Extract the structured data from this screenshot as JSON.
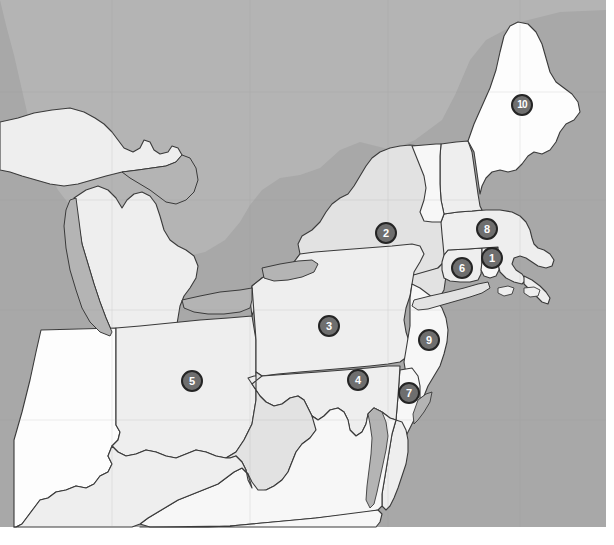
{
  "map": {
    "title": "Northeastern United States Reference Map",
    "projection": "geographic",
    "width": 614,
    "height": 545,
    "colors": {
      "water": "#a8a8a8",
      "land_default": "#e2e2e2",
      "land_light": "#eeeeee",
      "land_lighter": "#f7f7f7",
      "land_white": "#fdfdfd",
      "border": "#3a3a3a",
      "border_thin": "#555555",
      "marker_fill": "#6e6e6e",
      "marker_stroke": "#242424",
      "marker_text": "#ffffff",
      "page_background": "#ffffff"
    },
    "markers": [
      {
        "id": "marker-1",
        "label": "1",
        "x": 492,
        "y": 258,
        "region": "Rhode Island"
      },
      {
        "id": "marker-2",
        "label": "2",
        "x": 386,
        "y": 233,
        "region": "New York"
      },
      {
        "id": "marker-3",
        "label": "3",
        "x": 329,
        "y": 326,
        "region": "Pennsylvania"
      },
      {
        "id": "marker-4",
        "label": "4",
        "x": 358,
        "y": 380,
        "region": "Maryland"
      },
      {
        "id": "marker-5",
        "label": "5",
        "x": 192,
        "y": 381,
        "region": "Ohio"
      },
      {
        "id": "marker-6",
        "label": "6",
        "x": 462,
        "y": 268,
        "region": "Connecticut"
      },
      {
        "id": "marker-7",
        "label": "7",
        "x": 409,
        "y": 393,
        "region": "Delaware"
      },
      {
        "id": "marker-8",
        "label": "8",
        "x": 487,
        "y": 229,
        "region": "Massachusetts"
      },
      {
        "id": "marker-9",
        "label": "9",
        "x": 429,
        "y": 340,
        "region": "New Jersey"
      },
      {
        "id": "marker-10",
        "label": "10",
        "x": 522,
        "y": 105,
        "region": "Maine"
      }
    ],
    "regions": [
      {
        "name": "Maine",
        "shade": "white"
      },
      {
        "name": "New Hampshire",
        "shade": "light"
      },
      {
        "name": "Vermont",
        "shade": "lighter"
      },
      {
        "name": "Massachusetts",
        "shade": "light"
      },
      {
        "name": "Rhode Island",
        "shade": "lighter"
      },
      {
        "name": "Connecticut",
        "shade": "light"
      },
      {
        "name": "New York",
        "shade": "default"
      },
      {
        "name": "New Jersey",
        "shade": "lighter"
      },
      {
        "name": "Pennsylvania",
        "shade": "light"
      },
      {
        "name": "Delaware",
        "shade": "lighter"
      },
      {
        "name": "Maryland",
        "shade": "light"
      },
      {
        "name": "Virginia",
        "shade": "lighter"
      },
      {
        "name": "West Virginia",
        "shade": "default"
      },
      {
        "name": "Ohio",
        "shade": "light"
      },
      {
        "name": "Indiana",
        "shade": "white"
      },
      {
        "name": "Michigan",
        "shade": "light"
      },
      {
        "name": "Kentucky",
        "shade": "light"
      },
      {
        "name": "North Carolina",
        "shade": "lighter"
      },
      {
        "name": "Ontario",
        "shade": "default"
      },
      {
        "name": "Quebec",
        "shade": "default"
      }
    ],
    "water_bodies": [
      {
        "name": "Lake Michigan"
      },
      {
        "name": "Lake Huron"
      },
      {
        "name": "Lake Erie"
      },
      {
        "name": "Lake Ontario"
      },
      {
        "name": "Atlantic Ocean"
      },
      {
        "name": "Chesapeake Bay"
      },
      {
        "name": "Long Island Sound"
      }
    ]
  }
}
